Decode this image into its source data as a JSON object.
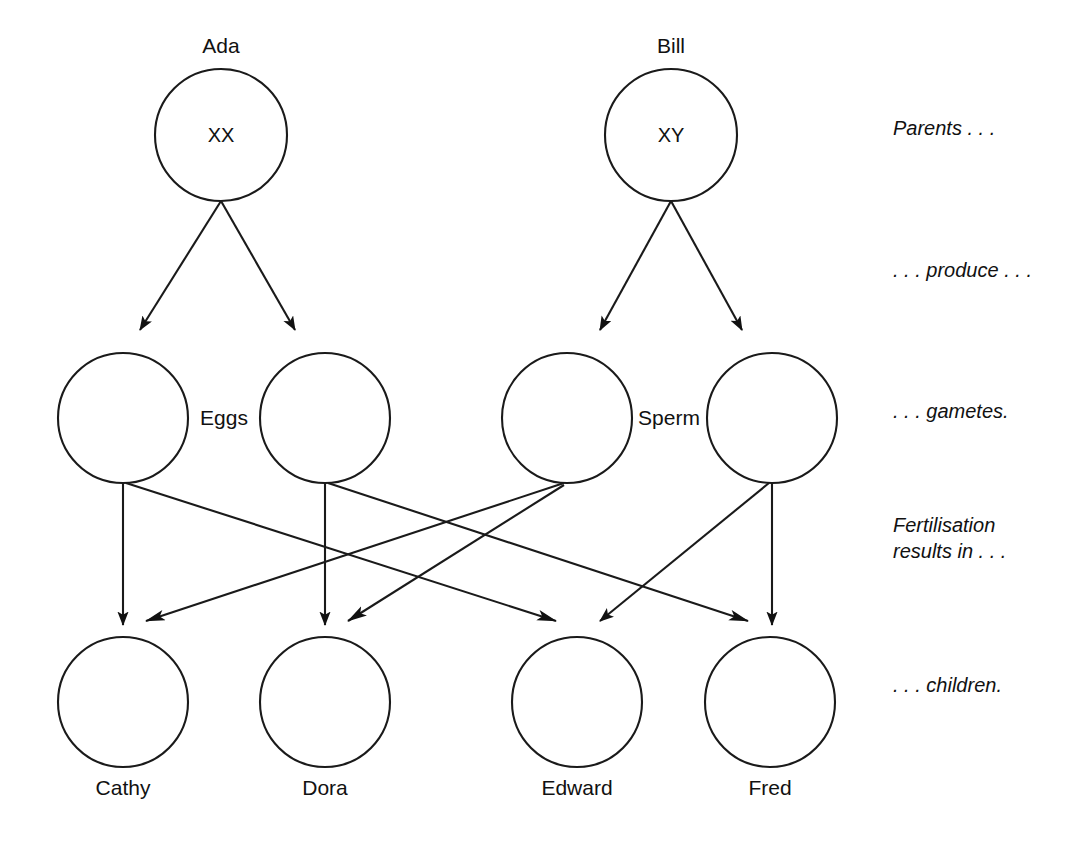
{
  "diagram": {
    "colors": {
      "background": "#ffffff",
      "stroke": "#1a1a1a",
      "arrow_fill": "#111111",
      "text": "#111111"
    },
    "parents": [
      {
        "name": "Ada",
        "genotype": "XX",
        "cx": 221,
        "cy": 135,
        "r": 66
      },
      {
        "name": "Bill",
        "genotype": "XY",
        "cx": 671,
        "cy": 135,
        "r": 66
      }
    ],
    "gametes": [
      {
        "id": "egg-1",
        "kind": "egg",
        "cx": 123,
        "cy": 418,
        "r": 65
      },
      {
        "id": "egg-2",
        "kind": "egg",
        "cx": 325,
        "cy": 418,
        "r": 65
      },
      {
        "id": "sperm-1",
        "kind": "sperm",
        "cx": 567,
        "cy": 418,
        "r": 65
      },
      {
        "id": "sperm-2",
        "kind": "sperm",
        "cx": 772,
        "cy": 418,
        "r": 65
      }
    ],
    "gamete_group_labels": [
      {
        "text": "Eggs",
        "x": 224,
        "y": 418
      },
      {
        "text": "Sperm",
        "x": 669,
        "y": 418
      }
    ],
    "children": [
      {
        "name": "Cathy",
        "cx": 123,
        "cy": 702,
        "r": 65
      },
      {
        "name": "Dora",
        "cx": 325,
        "cy": 702,
        "r": 65
      },
      {
        "name": "Edward",
        "cx": 577,
        "cy": 702,
        "r": 65
      },
      {
        "name": "Fred",
        "cx": 770,
        "cy": 702,
        "r": 65
      }
    ],
    "stage_annotations": [
      {
        "id": "parents",
        "lines": [
          "Parents . . ."
        ],
        "x": 893,
        "y": 135
      },
      {
        "id": "produce",
        "lines": [
          ". . . produce . . ."
        ],
        "x": 893,
        "y": 277
      },
      {
        "id": "gametes",
        "lines": [
          ". . . gametes."
        ],
        "x": 893,
        "y": 418
      },
      {
        "id": "fertilisation",
        "lines": [
          "Fertilisation",
          "results in . . ."
        ],
        "x": 893,
        "y": 532
      },
      {
        "id": "children",
        "lines": [
          ". . . children."
        ],
        "x": 893,
        "y": 692
      }
    ],
    "edges": [
      {
        "id": "ada-to-egg1",
        "from": "Ada",
        "to": "egg-1",
        "x1": 221,
        "y1": 201,
        "x2": 140,
        "y2": 330
      },
      {
        "id": "ada-to-egg2",
        "from": "Ada",
        "to": "egg-2",
        "x1": 221,
        "y1": 201,
        "x2": 295,
        "y2": 330
      },
      {
        "id": "bill-to-sperm1",
        "from": "Bill",
        "to": "sperm-1",
        "x1": 671,
        "y1": 201,
        "x2": 600,
        "y2": 330
      },
      {
        "id": "bill-to-sperm2",
        "from": "Bill",
        "to": "sperm-2",
        "x1": 671,
        "y1": 201,
        "x2": 742,
        "y2": 330
      },
      {
        "id": "egg1-to-cathy",
        "from": "egg-1",
        "to": "Cathy",
        "x1": 123,
        "y1": 483,
        "x2": 123,
        "y2": 625
      },
      {
        "id": "egg2-to-dora",
        "from": "egg-2",
        "to": "Dora",
        "x1": 325,
        "y1": 483,
        "x2": 325,
        "y2": 625
      },
      {
        "id": "sperm2-to-fred",
        "from": "sperm-2",
        "to": "Fred",
        "x1": 772,
        "y1": 483,
        "x2": 772,
        "y2": 625
      },
      {
        "id": "egg1-to-edward",
        "from": "egg-1",
        "to": "Edward",
        "x1": 126,
        "y1": 483,
        "x2": 556,
        "y2": 621
      },
      {
        "id": "egg2-to-fred",
        "from": "egg-2",
        "to": "Fred",
        "x1": 328,
        "y1": 483,
        "x2": 748,
        "y2": 621
      },
      {
        "id": "sperm1-to-cathy",
        "from": "sperm-1",
        "to": "Cathy",
        "x1": 564,
        "y1": 483,
        "x2": 146,
        "y2": 621
      },
      {
        "id": "sperm1-to-dora",
        "from": "sperm-1",
        "to": "Dora",
        "x1": 564,
        "y1": 485,
        "x2": 348,
        "y2": 621
      },
      {
        "id": "sperm2-to-edward",
        "from": "sperm-2",
        "to": "Edward",
        "x1": 769,
        "y1": 483,
        "x2": 600,
        "y2": 621
      }
    ]
  }
}
